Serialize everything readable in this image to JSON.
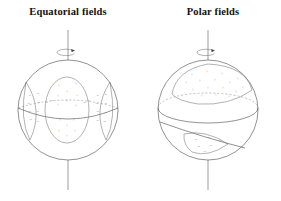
{
  "figure": {
    "background_color": "#ffffff",
    "line_color": "#4a4a4a",
    "text_color": "#111111",
    "width": 281,
    "height": 201
  },
  "panels": [
    {
      "id": "equatorial",
      "title": "Equatorial fields",
      "sphere": {
        "cx": 68,
        "cy": 110,
        "r": 50
      },
      "axis": {
        "x": 68,
        "top_y": 30,
        "bottom_y": 190
      },
      "rotation_marker": {
        "cx": 68,
        "cy": 52,
        "rx": 9,
        "ry": 3.2
      },
      "positive_sign": "+",
      "negative_sign": "−",
      "plus_points": [
        [
          59,
          86
        ],
        [
          76,
          84
        ],
        [
          67,
          92
        ],
        [
          58,
          96
        ],
        [
          77,
          96
        ],
        [
          67,
          101
        ],
        [
          58,
          105
        ],
        [
          76,
          106
        ],
        [
          60,
          120
        ],
        [
          74,
          120
        ],
        [
          67,
          126
        ],
        [
          59,
          131
        ],
        [
          75,
          131
        ],
        [
          67,
          136
        ]
      ],
      "minus_left_points": [
        [
          30,
          96
        ],
        [
          38,
          94
        ],
        [
          29,
          104
        ],
        [
          39,
          103
        ],
        [
          30,
          112
        ],
        [
          38,
          112
        ],
        [
          31,
          120
        ],
        [
          38,
          122
        ]
      ],
      "minus_right_points": [
        [
          98,
          96
        ],
        [
          106,
          95
        ],
        [
          97,
          104
        ],
        [
          106,
          104
        ],
        [
          98,
          112
        ],
        [
          106,
          113
        ],
        [
          98,
          121
        ],
        [
          105,
          122
        ]
      ],
      "mid_minus_points": [
        [
          47,
          103
        ],
        [
          52,
          101
        ],
        [
          85,
          103
        ],
        [
          89,
          101
        ]
      ]
    },
    {
      "id": "polar",
      "title": "Polar fields",
      "sphere": {
        "cx": 208,
        "cy": 110,
        "r": 50
      },
      "axis": {
        "x": 208,
        "top_y": 30,
        "bottom_y": 190
      },
      "rotation_marker": {
        "cx": 208,
        "cy": 52,
        "rx": 9,
        "ry": 3.2
      },
      "positive_sign": "+",
      "negative_sign": "−",
      "plus_points": [
        [
          192,
          75
        ],
        [
          207,
          72
        ],
        [
          222,
          74
        ],
        [
          238,
          79
        ],
        [
          186,
          83
        ],
        [
          200,
          81
        ],
        [
          215,
          80
        ],
        [
          230,
          83
        ],
        [
          243,
          88
        ],
        [
          193,
          90
        ],
        [
          208,
          88
        ],
        [
          223,
          88
        ],
        [
          236,
          92
        ],
        [
          202,
          96
        ],
        [
          216,
          95
        ],
        [
          229,
          97
        ]
      ],
      "minus_points": [
        [
          196,
          140
        ],
        [
          209,
          138
        ],
        [
          220,
          141
        ],
        [
          199,
          147
        ],
        [
          211,
          146
        ],
        [
          205,
          152
        ]
      ]
    }
  ]
}
